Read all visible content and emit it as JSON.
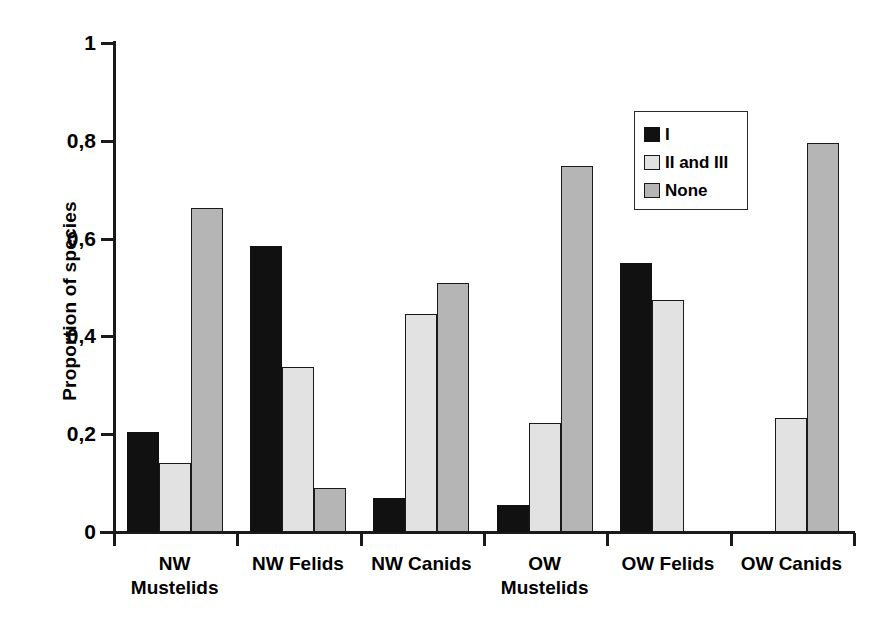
{
  "chart_data": {
    "type": "bar",
    "title": "",
    "xlabel": "",
    "ylabel": "Proportion of species",
    "ylim": [
      0,
      1
    ],
    "ytick_labels": [
      "1",
      "0,8",
      "0,6",
      "0,4",
      "0,2",
      "0"
    ],
    "ytick_values": [
      1,
      0.8,
      0.6,
      0.4,
      0.2,
      0
    ],
    "grid": false,
    "legend_position": "upper right",
    "categories": [
      "NW\nMustelids",
      "NW Felids",
      "NW Canids",
      "OW\nMustelids",
      "OW Felids",
      "OW Canids"
    ],
    "series": [
      {
        "name": "I",
        "color": "#111111",
        "values": [
          0.205,
          0.585,
          0.07,
          0.055,
          0.55,
          0.0
        ]
      },
      {
        "name": "II and III",
        "color": "#e2e2e2",
        "values": [
          0.141,
          0.337,
          0.446,
          0.223,
          0.474,
          0.233
        ]
      },
      {
        "name": "None",
        "color": "#b5b5b5",
        "values": [
          0.663,
          0.09,
          0.509,
          0.748,
          0.0,
          0.795
        ]
      }
    ]
  },
  "legend": {
    "items": [
      {
        "label": "I"
      },
      {
        "label": "II and III"
      },
      {
        "label": "None"
      }
    ]
  }
}
